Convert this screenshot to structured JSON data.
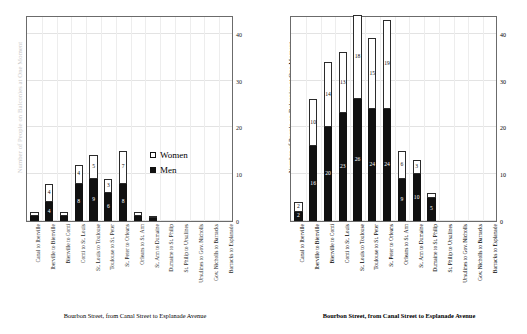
{
  "figure": {
    "ylabel": "Number of People on Balconies at One Moment",
    "xcaption": "Bourbon Street, from Canal Street to Esplanade Avenue",
    "legend": {
      "women_label": "Women",
      "men_label": "Men"
    },
    "yticks": [
      "0",
      "10",
      "20",
      "30",
      "40"
    ]
  },
  "chart_data": [
    {
      "type": "bar",
      "title": "",
      "subtype": "stacked",
      "panel": "left",
      "xlabel": "Bourbon Street, from Canal Street to Esplanade Avenue",
      "ylabel": "Number of People on Balconies at One Moment",
      "ylim": [
        0,
        44
      ],
      "yticks": [
        0,
        10,
        20,
        30,
        40
      ],
      "grid": true,
      "legend_position": "center-right",
      "categories": [
        "Canal to Iberville",
        "Iberville to Bienville",
        "Bienville to Conti",
        "Conti to St. Louis",
        "St. Louis to Toulouse",
        "Toulouse to St. Peter",
        "St. Peter to Orleans",
        "Orleans to St. Ann",
        "St. Ann to Dumaine",
        "Dumaine to St. Philip",
        "St. Philip to Ursulines",
        "Ursulines to Gov. Nicholls",
        "Gov. Nicholls to Barracks",
        "Barracks to Esplanade"
      ],
      "series": [
        {
          "name": "Men",
          "values": [
            1,
            4,
            1,
            8,
            9,
            6,
            8,
            1,
            1,
            0,
            0,
            0,
            0,
            0
          ]
        },
        {
          "name": "Women",
          "values": [
            1,
            4,
            1,
            4,
            5,
            3,
            7,
            1,
            0,
            0,
            0,
            0,
            0,
            0
          ]
        }
      ]
    },
    {
      "type": "bar",
      "title": "",
      "subtype": "stacked",
      "panel": "right",
      "xlabel": "Bourbon Street, from Canal Street to Esplanade Avenue",
      "ylabel": "Number of People on Balconies at One Moment",
      "ylim": [
        0,
        44
      ],
      "yticks": [
        0,
        10,
        20,
        30,
        40
      ],
      "grid": true,
      "legend_position": "none",
      "categories": [
        "Canal to Iberville",
        "Iberville to Bienville",
        "Bienville to Conti",
        "Conti to St. Louis",
        "St. Louis to Toulouse",
        "Toulouse to St. Peter",
        "St. Peter to Orleans",
        "Orleans to St. Ann",
        "St. Ann to Dumaine",
        "Dumaine to St. Philip",
        "St. Philip to Ursulines",
        "Ursulines to Gov. Nicholls",
        "Gov. Nicholls to Barracks",
        "Barracks to Esplanade"
      ],
      "series": [
        {
          "name": "Men",
          "values": [
            2,
            16,
            20,
            23,
            26,
            24,
            24,
            9,
            10,
            5,
            0,
            0,
            0,
            0
          ]
        },
        {
          "name": "Women",
          "values": [
            2,
            10,
            14,
            13,
            18,
            15,
            19,
            6,
            3,
            1,
            0,
            0,
            0,
            0
          ]
        }
      ]
    }
  ]
}
